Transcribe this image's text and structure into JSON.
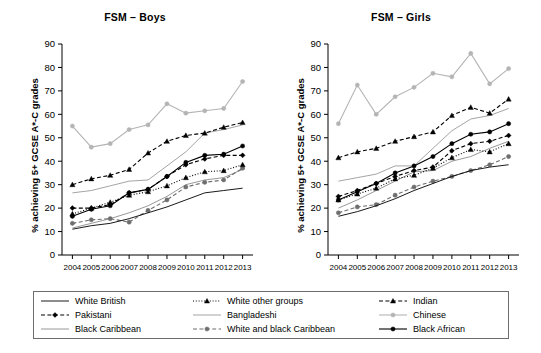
{
  "figure": {
    "background": "#ffffff",
    "axis_color": "#000000"
  },
  "panels": [
    {
      "id": "boys",
      "title": "FSM – Boys",
      "ylabel": "% achieving 5+ GCSE A*-C grades"
    },
    {
      "id": "girls",
      "title": "FSM – Girls",
      "ylabel": "% achieving 5+ GCSE A*-C grades"
    }
  ],
  "legend": {
    "items": [
      {
        "label": "White British",
        "style": "solid",
        "marker": "none",
        "color": "#000000"
      },
      {
        "label": "White other groups",
        "style": "dotted",
        "marker": "triangle",
        "color": "#000000"
      },
      {
        "label": "Indian",
        "style": "dashed",
        "marker": "triangle",
        "color": "#000000"
      },
      {
        "label": "Pakistani",
        "style": "dashed",
        "marker": "diamond",
        "color": "#000000"
      },
      {
        "label": "Bangladeshi",
        "style": "solid",
        "marker": "none",
        "color": "#9a9a9a"
      },
      {
        "label": "Chinese",
        "style": "solid",
        "marker": "circle",
        "color": "#b4b4b4"
      },
      {
        "label": "Black Caribbean",
        "style": "solid",
        "marker": "none",
        "color": "#8c8c8c"
      },
      {
        "label": "White and black Caribbean",
        "style": "dashed",
        "marker": "circle",
        "color": "#6e6e6e"
      },
      {
        "label": "Black African",
        "style": "solid",
        "marker": "circle",
        "color": "#000000"
      }
    ]
  },
  "chart_data": [
    {
      "type": "line",
      "title": "FSM – Boys",
      "xlabel": "",
      "ylabel": "% achieving 5+ GCSE A*-C grades",
      "x": [
        2004,
        2005,
        2006,
        2007,
        2008,
        2009,
        2010,
        2011,
        2012,
        2013
      ],
      "ylim": [
        0,
        90
      ],
      "yticks": [
        0,
        10,
        20,
        30,
        40,
        50,
        60,
        70,
        80,
        90
      ],
      "xticklabels": [
        "2004",
        "2005",
        "2006",
        "2007",
        "2008",
        "2009",
        "2010",
        "2011",
        "2012",
        "2013"
      ],
      "grid": false,
      "legend_position": "bottom",
      "series": [
        {
          "name": "White British",
          "values": [
            11.0,
            12.5,
            13.5,
            15.5,
            18.0,
            20.5,
            23.5,
            26.5,
            27.5,
            28.5
          ]
        },
        {
          "name": "White other groups",
          "values": [
            17.5,
            20.0,
            22.5,
            25.5,
            27.0,
            29.5,
            33.0,
            35.5,
            36.0,
            38.5
          ]
        },
        {
          "name": "Indian",
          "values": [
            30.0,
            32.5,
            34.0,
            36.5,
            43.5,
            48.5,
            51.0,
            52.0,
            54.5,
            56.5
          ]
        },
        {
          "name": "Pakistani",
          "values": [
            20.0,
            20.0,
            21.5,
            26.5,
            28.0,
            33.5,
            38.5,
            41.0,
            42.5,
            42.5
          ]
        },
        {
          "name": "Bangladeshi",
          "values": [
            26.5,
            27.5,
            29.5,
            31.5,
            32.0,
            38.0,
            44.0,
            52.0,
            53.5,
            55.5
          ]
        },
        {
          "name": "Chinese",
          "values": [
            55.0,
            46.0,
            47.5,
            53.5,
            55.5,
            64.5,
            60.5,
            61.5,
            62.5,
            74.0
          ]
        },
        {
          "name": "Black Caribbean",
          "values": [
            11.5,
            13.5,
            15.5,
            18.0,
            21.0,
            25.0,
            30.0,
            32.0,
            33.0,
            36.5
          ]
        },
        {
          "name": "White and black Caribbean",
          "values": [
            13.5,
            15.0,
            15.5,
            14.0,
            19.0,
            23.5,
            29.0,
            31.0,
            32.0,
            37.0
          ]
        },
        {
          "name": "Black African",
          "values": [
            16.5,
            19.5,
            21.0,
            26.5,
            28.0,
            33.5,
            39.5,
            42.5,
            43.0,
            46.5
          ]
        }
      ]
    },
    {
      "type": "line",
      "title": "FSM – Girls",
      "xlabel": "",
      "ylabel": "% achieving 5+ GCSE A*-C grades",
      "x": [
        2004,
        2005,
        2006,
        2007,
        2008,
        2009,
        2010,
        2011,
        2012,
        2013
      ],
      "ylim": [
        0,
        90
      ],
      "yticks": [
        0,
        10,
        20,
        30,
        40,
        50,
        60,
        70,
        80,
        90
      ],
      "xticklabels": [
        "2004",
        "2005",
        "2006",
        "2007",
        "2008",
        "2009",
        "2010",
        "2011",
        "2012",
        "2013"
      ],
      "grid": false,
      "legend_position": "bottom",
      "series": [
        {
          "name": "White British",
          "values": [
            16.5,
            18.5,
            21.0,
            24.0,
            27.5,
            30.5,
            33.5,
            36.0,
            37.5,
            38.5
          ]
        },
        {
          "name": "White other groups",
          "values": [
            23.5,
            26.0,
            28.5,
            32.5,
            34.0,
            37.0,
            41.5,
            45.0,
            44.0,
            47.5
          ]
        },
        {
          "name": "Indian",
          "values": [
            41.5,
            44.0,
            45.5,
            48.5,
            50.5,
            52.5,
            59.5,
            63.0,
            60.5,
            66.5
          ]
        },
        {
          "name": "Pakistani",
          "values": [
            25.0,
            27.5,
            30.5,
            33.5,
            36.0,
            37.5,
            44.5,
            47.5,
            48.5,
            51.0
          ]
        },
        {
          "name": "Bangladeshi",
          "values": [
            31.5,
            33.0,
            34.5,
            38.0,
            38.0,
            45.5,
            53.0,
            58.0,
            59.5,
            62.5
          ]
        },
        {
          "name": "Chinese",
          "values": [
            56.0,
            72.5,
            60.0,
            67.5,
            71.5,
            77.5,
            76.0,
            86.0,
            73.0,
            79.5
          ]
        },
        {
          "name": "Black Caribbean",
          "values": [
            20.0,
            23.5,
            27.5,
            31.5,
            35.5,
            36.0,
            40.0,
            42.0,
            45.5,
            48.5
          ]
        },
        {
          "name": "White and black Caribbean",
          "values": [
            18.0,
            20.5,
            21.5,
            25.5,
            29.0,
            31.5,
            33.5,
            36.0,
            38.5,
            42.0
          ]
        },
        {
          "name": "Black African",
          "values": [
            23.5,
            27.0,
            30.5,
            35.0,
            38.0,
            42.0,
            47.5,
            51.5,
            52.5,
            56.0
          ]
        }
      ]
    }
  ]
}
